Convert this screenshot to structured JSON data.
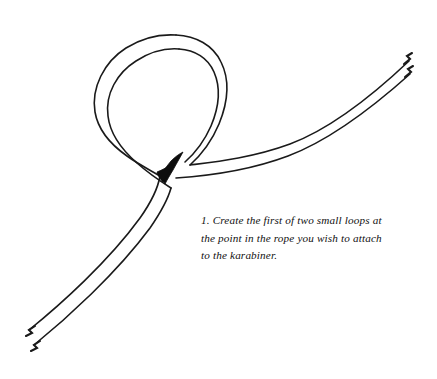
{
  "figure": {
    "background_color": "#ffffff",
    "stroke_color": "#1a1a1a",
    "crossing_shade_color": "#0d0d0d",
    "stroke_width": 1.6,
    "rope_width_px": 13,
    "parts": {
      "loop": "rope-loop",
      "crossing": "rope-crossing-shade",
      "tail_upper_right": "rope-tail-upper-right",
      "tail_lower_left": "rope-tail-lower-left",
      "end_tip_upper_outer": "rope-end-upper-outer",
      "end_tip_upper_inner": "rope-end-upper-inner",
      "end_tip_lower_outer": "rope-end-lower-outer",
      "end_tip_lower_inner": "rope-end-lower-inner"
    }
  },
  "caption": {
    "lines": [
      "1. Create the first of two small loops at",
      "the point in the rope you wish to attach",
      "to the karabiner."
    ],
    "line1": "1. Create the first of two small loops at",
    "line2": "the point in the rope you wish to attach",
    "line3": "to the karabiner.",
    "step_number": "1.",
    "color": "#111111"
  }
}
